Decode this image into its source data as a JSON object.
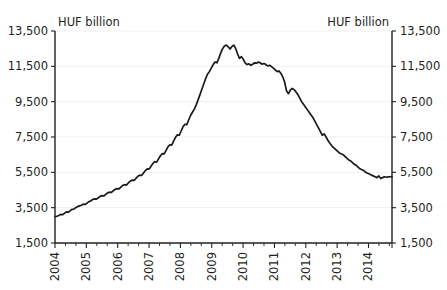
{
  "chart_data": {
    "type": "line",
    "title": "",
    "subtitle": "",
    "xlabel": "",
    "ylabel": "HUF billion",
    "unit_label_left": "HUF billion",
    "unit_label_right": "HUF billion",
    "ylim": [
      1500,
      13500
    ],
    "yticks": [
      1500,
      3500,
      5500,
      7500,
      9500,
      11500,
      13500
    ],
    "ytick_labels": [
      "1,500",
      "3,500",
      "5,500",
      "7,500",
      "9,500",
      "11,500",
      "13,500"
    ],
    "xlim": [
      2004.0,
      2014.75
    ],
    "xticks": [
      2004,
      2005,
      2006,
      2007,
      2008,
      2009,
      2010,
      2011,
      2012,
      2013,
      2014
    ],
    "xtick_labels": [
      "2004",
      "2005",
      "2006",
      "2007",
      "2008",
      "2009",
      "2010",
      "2011",
      "2012",
      "2013",
      "2014"
    ],
    "xtick_rotation": -90,
    "minor_xticks_per_year": 2,
    "grid": true,
    "grid_axis": "y",
    "grid_color": "#f0f0f2",
    "legend": false,
    "legend_position": "none",
    "axis_color": "#231f20",
    "line_color": "#1a1a1a",
    "background_color": "#ffffff",
    "series": [
      {
        "name": "HUF billion",
        "color": "#1a1a1a",
        "x": [
          2004.0,
          2004.08,
          2004.17,
          2004.25,
          2004.33,
          2004.42,
          2004.5,
          2004.58,
          2004.67,
          2004.75,
          2004.83,
          2004.92,
          2005.0,
          2005.08,
          2005.17,
          2005.25,
          2005.33,
          2005.42,
          2005.5,
          2005.58,
          2005.67,
          2005.75,
          2005.83,
          2005.92,
          2006.0,
          2006.08,
          2006.17,
          2006.25,
          2006.33,
          2006.42,
          2006.5,
          2006.58,
          2006.67,
          2006.75,
          2006.83,
          2006.92,
          2007.0,
          2007.08,
          2007.17,
          2007.25,
          2007.33,
          2007.42,
          2007.5,
          2007.58,
          2007.67,
          2007.75,
          2007.83,
          2007.92,
          2008.0,
          2008.08,
          2008.17,
          2008.25,
          2008.33,
          2008.42,
          2008.5,
          2008.58,
          2008.67,
          2008.75,
          2008.83,
          2008.92,
          2009.0,
          2009.08,
          2009.17,
          2009.25,
          2009.33,
          2009.42,
          2009.5,
          2009.58,
          2009.67,
          2009.75,
          2009.83,
          2009.92,
          2010.0,
          2010.08,
          2010.17,
          2010.25,
          2010.33,
          2010.42,
          2010.5,
          2010.58,
          2010.67,
          2010.75,
          2010.83,
          2010.92,
          2011.0,
          2011.08,
          2011.17,
          2011.25,
          2011.33,
          2011.42,
          2011.5,
          2011.58,
          2011.67,
          2011.75,
          2011.83,
          2011.92,
          2012.0,
          2012.08,
          2012.17,
          2012.25,
          2012.33,
          2012.42,
          2012.5,
          2012.58,
          2012.67,
          2012.75,
          2012.83,
          2012.92,
          2013.0,
          2013.08,
          2013.17,
          2013.25,
          2013.33,
          2013.42,
          2013.5,
          2013.58,
          2013.67,
          2013.75,
          2013.83,
          2013.92,
          2014.0,
          2014.08,
          2014.17,
          2014.25,
          2014.33,
          2014.42,
          2014.5,
          2014.58,
          2014.67,
          2014.75
        ],
        "values": [
          3000,
          3010,
          3060,
          3120,
          3100,
          3180,
          3260,
          3240,
          3320,
          3400,
          3420,
          3500,
          3560,
          3600,
          3640,
          3700,
          3680,
          3760,
          3840,
          3880,
          3960,
          4000,
          3980,
          4060,
          4140,
          4180,
          4160,
          4260,
          4340,
          4380,
          4360,
          4460,
          4540,
          4580,
          4560,
          4660,
          4760,
          4800,
          4780,
          4900,
          5000,
          5060,
          5040,
          5160,
          5280,
          5340,
          5320,
          5460,
          5600,
          5700,
          5680,
          5840,
          6000,
          6100,
          6080,
          6260,
          6440,
          6560,
          6540,
          6740,
          6940,
          7060,
          7040,
          7260,
          7480,
          7620,
          7600,
          7840,
          8080,
          8220,
          8200,
          8460,
          8720,
          8900,
          9080,
          9320,
          9600,
          9900,
          10200,
          10500,
          10800,
          11050,
          11200,
          11400,
          11600,
          11750,
          11700,
          11950,
          12250,
          12500,
          12650,
          12700,
          12600,
          12480,
          12620,
          12700,
          12500,
          12200,
          11950,
          12050,
          11900,
          11700,
          11600,
          11640,
          11560,
          11620,
          11700,
          11680,
          11740,
          11700,
          11620,
          11660,
          11600,
          11520,
          11560,
          11480,
          11400,
          11300,
          11200,
          11240,
          11100,
          10900,
          10600,
          10100,
          9950,
          10150,
          10250,
          10180,
          10050,
          9900
        ],
        "values_continued": [
          9700,
          9500,
          9350,
          9200,
          9050,
          8900,
          8750,
          8600,
          8400,
          8200,
          8000,
          7800,
          7600,
          7680,
          7500,
          7300,
          7150,
          7000,
          6900,
          6800,
          6700,
          6600,
          6550,
          6500,
          6400,
          6300,
          6200,
          6150,
          6050,
          5950,
          5900,
          5800,
          5700,
          5650,
          5600,
          5500,
          5450,
          5400,
          5350,
          5300,
          5250,
          5200,
          5300,
          5150,
          5200,
          5250,
          5220,
          5240,
          5250,
          5260
        ]
      }
    ],
    "annotations": []
  }
}
